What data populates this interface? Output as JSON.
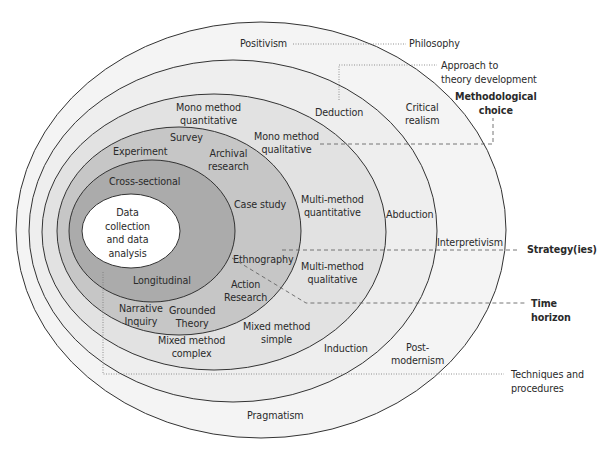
{
  "diagram": {
    "layers": [
      {
        "name": "Philosophy",
        "fill": "#f4f4f4",
        "items": [
          "Positivism",
          "Critical realism",
          "Interpretivism",
          "Post-modernism",
          "Pragmatism"
        ]
      },
      {
        "name": "Approach to theory development",
        "fill": "#eeeeee",
        "items": [
          "Deduction",
          "Abduction",
          "Induction"
        ]
      },
      {
        "name": "Methodological choice",
        "fill": "#e2e2e2",
        "items": [
          "Mono method quantitative",
          "Mono method qualitative",
          "Multi-method quantitative",
          "Multi-method qualitative",
          "Mixed method simple",
          "Mixed method complex"
        ]
      },
      {
        "name": "Strategy(ies)",
        "fill": "#c6c6c6",
        "items": [
          "Experiment",
          "Survey",
          "Archival research",
          "Case study",
          "Ethnography",
          "Action Research",
          "Grounded Theory",
          "Narrative Inquiry"
        ]
      },
      {
        "name": "Time horizon",
        "fill": "#ababab",
        "items": [
          "Cross-sectional",
          "Longitudinal"
        ]
      },
      {
        "name": "Techniques and procedures",
        "fill": "#ffffff",
        "items": [
          "Data collection and data analysis"
        ]
      }
    ],
    "inner": {
      "positivism": "Positivism",
      "critical_realism_1": "Critical",
      "critical_realism_2": "realism",
      "interpretivism": "Interpretivism",
      "postmodernism_1": "Post-",
      "postmodernism_2": "modernism",
      "pragmatism": "Pragmatism",
      "deduction": "Deduction",
      "abduction": "Abduction",
      "induction": "Induction",
      "mono_quant_1": "Mono method",
      "mono_quant_2": "quantitative",
      "mono_qual_1": "Mono method",
      "mono_qual_2": "qualitative",
      "multi_quant_1": "Multi-method",
      "multi_quant_2": "quantitative",
      "multi_qual_1": "Multi-method",
      "multi_qual_2": "qualitative",
      "mixed_simple_1": "Mixed method",
      "mixed_simple_2": "simple",
      "mixed_complex_1": "Mixed method",
      "mixed_complex_2": "complex",
      "experiment": "Experiment",
      "survey": "Survey",
      "archival_1": "Archival",
      "archival_2": "research",
      "case_study": "Case study",
      "ethnography": "Ethnography",
      "action_1": "Action",
      "action_2": "Research",
      "grounded_1": "Grounded",
      "grounded_2": "Theory",
      "narrative_1": "Narrative",
      "narrative_2": "Inquiry",
      "cross_sectional": "Cross-sectional",
      "longitudinal": "Longitudinal",
      "core_1": "Data",
      "core_2": "collection",
      "core_3": "and data",
      "core_4": "analysis"
    },
    "callouts": {
      "philosophy": "Philosophy",
      "approach_1": "Approach to",
      "approach_2": "theory development",
      "methodological_1": "Methodological",
      "methodological_2": "choice",
      "strategy": "Strategy(ies)",
      "time_1": "Time",
      "time_2": "horizon",
      "techniques_1": "Techniques and",
      "techniques_2": "procedures"
    },
    "colors": {
      "stroke": "#333333",
      "leader": "#777777",
      "text": "#2a2a2a"
    }
  }
}
